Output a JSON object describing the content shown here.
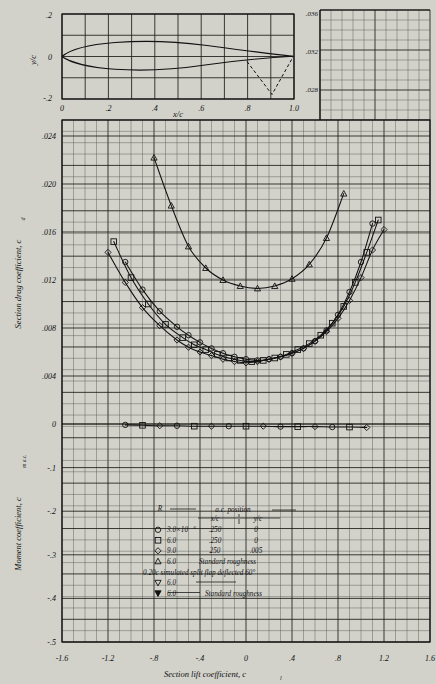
{
  "figure": {
    "background_color": "#d2d2cb",
    "paper_color": "#e9e9e2",
    "ink_color": "#111111"
  },
  "airfoil_panel": {
    "name": "airfoil-profile",
    "ylabel": "y/c",
    "xlabel": "x/c",
    "y_ticks": [
      ".2",
      "0",
      "-.2"
    ],
    "x_ticks": [
      "0",
      ".2",
      ".4",
      ".6",
      ".8",
      "1.0"
    ],
    "ylim": [
      -0.2,
      0.2
    ],
    "xlim": [
      0.0,
      1.0
    ],
    "flap_note": "dashed simulated split flap at 0.80c deflected 60 degrees"
  },
  "upper_right_panel": {
    "name": "drag-axis-extension",
    "y_ticks": [
      ".036",
      ".032",
      ".028"
    ]
  },
  "axes": {
    "drag_ylabel": "Section drag coefficient, c",
    "drag_ylabel_sub": "d",
    "drag_y_ticks": [
      ".024",
      ".020",
      ".016",
      ".012",
      ".008",
      ".004",
      "0"
    ],
    "moment_ylabel": "Moment coefficient, c",
    "moment_ylabel_sub": "m a.c.",
    "moment_y_ticks": [
      "-.1",
      "-.2",
      "-.3",
      "-.4",
      "-.5"
    ],
    "xlabel": "Section lift coefficient, c",
    "xlabel_sub": "l",
    "x_ticks": [
      "-1.6",
      "-1.2",
      "-.8",
      "-.4",
      "0",
      ".4",
      ".8",
      "1.2",
      "1.6"
    ]
  },
  "legend": {
    "header_R": "R",
    "header_ac": "a.c. position",
    "header_xc": "x/c",
    "header_yc": "y/c",
    "rows": [
      {
        "symbol": "circle",
        "R": "3.0×10",
        "R_exp": "6",
        "xc": ".250",
        "yc": "0",
        "note": ""
      },
      {
        "symbol": "square",
        "R": "6.0",
        "R_exp": "",
        "xc": ".250",
        "yc": "0",
        "note": ""
      },
      {
        "symbol": "diamond",
        "R": "9.0",
        "R_exp": "",
        "xc": "250",
        "yc": ".005",
        "note": ""
      },
      {
        "symbol": "triangle-up",
        "R": "6.0",
        "R_exp": "",
        "xc": "",
        "yc": "",
        "note": "Standard roughness"
      }
    ],
    "flap_line": "0.20c simulated split flap deflected 60°",
    "flap_rows": [
      {
        "symbol": "triangle-down",
        "R": "6.0",
        "note": ""
      },
      {
        "symbol": "triangle-down-filled",
        "R": "6.0",
        "note": "Standard roughness"
      }
    ]
  },
  "chart_data": {
    "type": "line",
    "title": "",
    "xlabel": "Section lift coefficient, c_l",
    "ylabel": "Section drag coefficient, c_d",
    "xlim": [
      -1.6,
      1.6
    ],
    "drag_ylim": [
      0,
      0.024
    ],
    "moment_ylim": [
      -0.5,
      0
    ],
    "grid": true,
    "legend_position": "lower-center",
    "series": [
      {
        "name": "R = 3.0x10^6, smooth",
        "symbol": "circle",
        "axis": "drag",
        "x": [
          -1.05,
          -0.9,
          -0.75,
          -0.6,
          -0.5,
          -0.4,
          -0.3,
          -0.2,
          -0.1,
          0.0,
          0.1,
          0.2,
          0.3,
          0.4,
          0.5,
          0.6,
          0.7,
          0.8,
          0.9,
          1.0,
          1.1
        ],
        "y": [
          0.0135,
          0.0112,
          0.0094,
          0.0081,
          0.0074,
          0.0068,
          0.0063,
          0.0059,
          0.0056,
          0.0054,
          0.0053,
          0.0054,
          0.0056,
          0.0059,
          0.0063,
          0.0069,
          0.0078,
          0.0091,
          0.011,
          0.0135,
          0.0167
        ]
      },
      {
        "name": "R = 6.0x10^6, smooth",
        "symbol": "square",
        "axis": "drag",
        "x": [
          -1.15,
          -1.0,
          -0.85,
          -0.7,
          -0.55,
          -0.45,
          -0.35,
          -0.25,
          -0.15,
          -0.05,
          0.05,
          0.15,
          0.25,
          0.35,
          0.45,
          0.55,
          0.65,
          0.75,
          0.85,
          0.95,
          1.05,
          1.15
        ],
        "y": [
          0.0152,
          0.0122,
          0.01,
          0.0083,
          0.0072,
          0.0066,
          0.0062,
          0.0058,
          0.0055,
          0.0053,
          0.0052,
          0.0053,
          0.0055,
          0.0058,
          0.0062,
          0.0067,
          0.0074,
          0.0084,
          0.0098,
          0.0118,
          0.0143,
          0.017
        ]
      },
      {
        "name": "R = 9.0x10^6, smooth",
        "symbol": "diamond",
        "axis": "drag",
        "x": [
          -1.2,
          -1.05,
          -0.9,
          -0.75,
          -0.6,
          -0.5,
          -0.4,
          -0.3,
          -0.2,
          -0.1,
          0.0,
          0.1,
          0.2,
          0.3,
          0.4,
          0.5,
          0.6,
          0.7,
          0.8,
          0.9,
          1.0,
          1.1,
          1.2
        ],
        "y": [
          0.0143,
          0.0118,
          0.0097,
          0.0082,
          0.007,
          0.0064,
          0.006,
          0.0057,
          0.0054,
          0.0052,
          0.0051,
          0.0052,
          0.0054,
          0.0056,
          0.0059,
          0.0063,
          0.0069,
          0.0077,
          0.0088,
          0.0103,
          0.0122,
          0.0145,
          0.0162
        ]
      },
      {
        "name": "R = 6.0x10^6, standard roughness",
        "symbol": "triangle-up",
        "axis": "drag",
        "x": [
          -0.8,
          -0.65,
          -0.5,
          -0.35,
          -0.2,
          -0.05,
          0.1,
          0.25,
          0.4,
          0.55,
          0.7,
          0.85
        ],
        "y": [
          0.0222,
          0.0182,
          0.0148,
          0.013,
          0.012,
          0.0115,
          0.0113,
          0.0115,
          0.0121,
          0.0133,
          0.0155,
          0.0192
        ]
      },
      {
        "name": "moment coefficient c_m a.c.",
        "symbol": "mixed",
        "axis": "moment",
        "x": [
          -1.05,
          -0.9,
          -0.75,
          -0.6,
          -0.45,
          -0.3,
          -0.15,
          0.0,
          0.15,
          0.3,
          0.45,
          0.6,
          0.75,
          0.9,
          1.05
        ],
        "y": [
          -0.002,
          -0.003,
          -0.004,
          -0.004,
          -0.005,
          -0.005,
          -0.005,
          -0.005,
          -0.005,
          -0.006,
          -0.006,
          -0.006,
          -0.007,
          -0.007,
          -0.008
        ]
      }
    ]
  }
}
